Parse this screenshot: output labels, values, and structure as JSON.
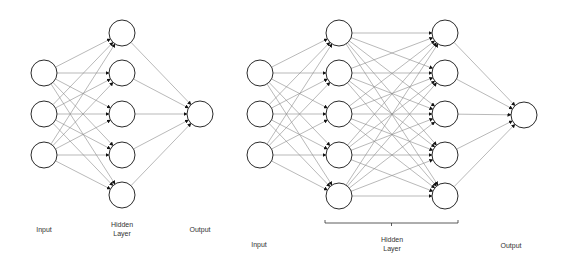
{
  "diagram": {
    "style": {
      "edge_color": "#8a8a8a",
      "node_stroke": "#2b2b2b",
      "node_fill": "#ffffff",
      "node_radius": 13,
      "bracket_color": "#333333"
    },
    "networks": [
      {
        "name": "shallow-network",
        "layers": [
          {
            "role": "input",
            "x": 44,
            "nodes_y": [
              73,
              114,
              155
            ]
          },
          {
            "role": "hidden",
            "x": 122,
            "nodes_y": [
              33,
              73,
              114,
              155,
              195
            ]
          },
          {
            "role": "output",
            "x": 200,
            "nodes_y": [
              114
            ]
          }
        ],
        "labels": {
          "input": {
            "text": "Input",
            "x": 44,
            "y": 225
          },
          "hidden_line1": {
            "text": "Hidden",
            "x": 122,
            "y": 220
          },
          "hidden_line2": {
            "text": "Layer",
            "x": 122,
            "y": 229
          },
          "output": {
            "text": "Output",
            "x": 200,
            "y": 225
          }
        }
      },
      {
        "name": "deep-network",
        "layers": [
          {
            "role": "input",
            "x": 260,
            "nodes_y": [
              73,
              114,
              155
            ]
          },
          {
            "role": "hidden",
            "x": 339,
            "nodes_y": [
              33,
              73,
              114,
              155,
              196
            ]
          },
          {
            "role": "hidden",
            "x": 445,
            "nodes_y": [
              33,
              73,
              114,
              155,
              196
            ]
          },
          {
            "role": "output",
            "x": 524,
            "nodes_y": [
              115
            ]
          }
        ],
        "bracket": {
          "x1": 325,
          "x2": 458,
          "y": 223
        },
        "labels": {
          "input": {
            "text": "Input",
            "x": 259,
            "y": 240
          },
          "hidden_line1": {
            "text": "Hidden",
            "x": 392,
            "y": 235
          },
          "hidden_line2": {
            "text": "Layer",
            "x": 392,
            "y": 244
          },
          "output": {
            "text": "Output",
            "x": 511,
            "y": 241
          }
        }
      }
    ]
  }
}
